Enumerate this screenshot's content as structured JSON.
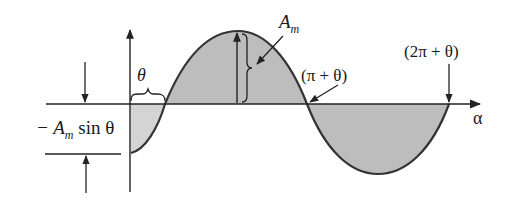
{
  "diagram": {
    "type": "phase-shifted sine waveform",
    "colors": {
      "line": "#333333",
      "fill": "#bdbdbd",
      "background": "#ffffff"
    },
    "labels": {
      "theta": "θ",
      "amplitude": {
        "main": "A",
        "sub": "m"
      },
      "neg_amplitude": {
        "prefix": "− A",
        "sub": "m",
        "suffix": " sin θ"
      },
      "pi_plus_theta": "(π  +  θ)",
      "two_pi_plus_theta": "(2π  +  θ)",
      "x_axis": "α"
    },
    "annotations": [
      "θ phase offset brace between vertical axis and first zero crossing",
      "A_m amplitude brace at positive peak",
      "(π + θ) arrow at second zero crossing",
      "(2π + θ) arrow at end of cycle",
      "− A_m sin θ dimension arrows showing initial value at α = 0"
    ]
  }
}
